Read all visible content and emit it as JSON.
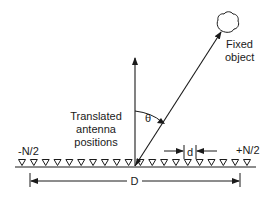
{
  "diagram": {
    "labels": {
      "fixed_object_line1": "Fixed",
      "fixed_object_line2": "object",
      "translated_line1": "Translated",
      "translated_line2": "antenna",
      "translated_line3": "positions",
      "theta": "θ",
      "left_end": "-N/2",
      "right_end": "+N/2",
      "spacing": "d",
      "aperture": "D"
    },
    "antenna_count": 20,
    "colors": {
      "stroke": "#1a1a1a",
      "background": "#ffffff"
    }
  }
}
